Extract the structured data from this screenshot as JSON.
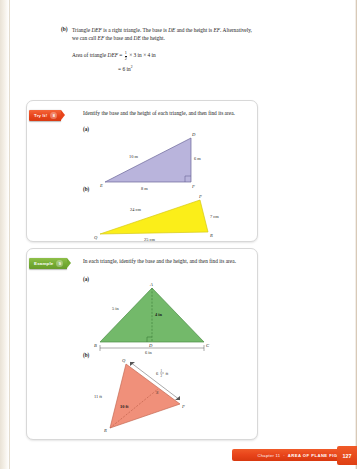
{
  "page": {
    "number": "127",
    "footer_chapter": "Chapter 11",
    "footer_title": "AREA OF PLANE FIGURES"
  },
  "top_block": {
    "item_label": "(b)",
    "paragraph": "Triangle DEF is a right triangle. The base is DE and the height is EF. Alternatively, we can call EF the base and DE the height.",
    "equation_lead": "Area of triangle DEF =",
    "frac_num": "1",
    "frac_den": "2",
    "equation_rest": "× 3 in × 4 in",
    "equation_result": "= 6 in",
    "equation_result_sup": "2"
  },
  "tryit": {
    "badge_label": "Try It!",
    "badge_number": "8",
    "instruction": "Identify the base and the height of each triangle, and then find its area.",
    "part_a_label": "(a)",
    "part_b_label": "(b)",
    "figure_a": {
      "name": "right-triangle-def",
      "fill": "#b9b4dc",
      "stroke": "#6a6598",
      "vertices": [
        {
          "label": "E",
          "x": 6,
          "y": 50
        },
        {
          "label": "D",
          "x": 92,
          "y": 3
        },
        {
          "label": "F",
          "x": 92,
          "y": 50
        }
      ],
      "dimensions": [
        {
          "label": "10 m",
          "x": 30,
          "y": 26
        },
        {
          "label": "6 m",
          "x": 96,
          "y": 28
        },
        {
          "label": "8 m",
          "x": 44,
          "y": 58
        }
      ]
    },
    "figure_b": {
      "name": "triangle-qpr-yellow",
      "fill": "#fbee19",
      "stroke": "#c9bd12",
      "vertices": [
        {
          "label": "Q",
          "x": 2,
          "y": 44
        },
        {
          "label": "P",
          "x": 104,
          "y": 6
        },
        {
          "label": "R",
          "x": 114,
          "y": 44
        }
      ],
      "dimensions": [
        {
          "label": "24 cm",
          "x": 36,
          "y": 20
        },
        {
          "label": "7 cm",
          "x": 110,
          "y": 25
        },
        {
          "label": "25 cm",
          "x": 52,
          "y": 53
        }
      ]
    }
  },
  "example": {
    "badge_label": "Example",
    "badge_number": "9",
    "instruction": "In each triangle, identify the base and the height, and then find its area.",
    "part_a_label": "(a)",
    "part_b_label": "(b)",
    "figure_a": {
      "name": "triangle-abc-green",
      "fill": "#73b96a",
      "stroke": "#4a8c45",
      "vertices": [
        {
          "label": "A",
          "x": 56,
          "y": 2
        },
        {
          "label": "B",
          "x": 2,
          "y": 60
        },
        {
          "label": "D",
          "x": 54,
          "y": 60
        },
        {
          "label": "C",
          "x": 110,
          "y": 60
        }
      ],
      "dimensions": [
        {
          "label": "5 in",
          "x": 18,
          "y": 26
        },
        {
          "label": "4 in",
          "x": 60,
          "y": 32
        },
        {
          "label": "6 in",
          "x": 50,
          "y": 70
        }
      ]
    },
    "figure_b": {
      "name": "triangle-pqr-salmon",
      "fill": "#f0907a",
      "stroke": "#c46a55",
      "vertices": [
        {
          "label": "Q",
          "x": 32,
          "y": 4
        },
        {
          "label": "S",
          "x": 78,
          "y": 26
        },
        {
          "label": "P",
          "x": 86,
          "y": 46
        },
        {
          "label": "R",
          "x": 10,
          "y": 74
        }
      ],
      "dimensions": [
        {
          "label": "11 ft",
          "x": 2,
          "y": 40
        },
        {
          "label": "10 ft",
          "x": 30,
          "y": 50
        },
        {
          "label_whole": "6",
          "label_num": "1",
          "label_den": "2",
          "label_unit": "ft",
          "x": 66,
          "y": 16
        }
      ]
    }
  }
}
